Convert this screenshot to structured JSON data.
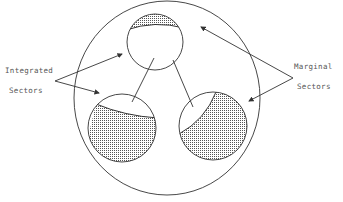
{
  "diagram": {
    "type": "sector-integration-diagram",
    "labels": {
      "integrated": [
        "Integrated",
        "Sectors"
      ],
      "marginal": [
        "Marginal",
        "Sectors"
      ]
    },
    "outer_circle": {
      "cx": 167,
      "cy": 98,
      "rx": 93,
      "ry": 97
    },
    "sectors": [
      {
        "name": "top",
        "cx": 155,
        "cy": 42,
        "r": 28,
        "shaded": "top cap (marginal)"
      },
      {
        "name": "bottom-left",
        "cx": 122,
        "cy": 128,
        "r": 34,
        "shaded": "lower portion (marginal)"
      },
      {
        "name": "bottom-right",
        "cx": 213,
        "cy": 126,
        "r": 34,
        "shaded": "right portion (marginal)"
      }
    ],
    "colors": {
      "line": "#333333",
      "text": "#555555",
      "stipple": "#444444"
    }
  }
}
